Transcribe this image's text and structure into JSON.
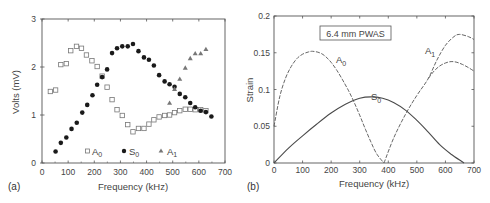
{
  "chart_data": [
    {
      "panel_label": "(a)",
      "type": "scatter",
      "title": "",
      "xlabel": "Frequency (kHz)",
      "ylabel": "Volts (mV)",
      "xlim": [
        0,
        700
      ],
      "ylim": [
        0,
        3
      ],
      "xticks": [
        0,
        100,
        200,
        300,
        400,
        500,
        600,
        700
      ],
      "yticks": [
        0,
        1,
        2,
        3
      ],
      "grid": false,
      "legend_position": "bottom-inside",
      "series": [
        {
          "name": "A0",
          "label_main": "A",
          "label_sub": "0",
          "marker": "open-square",
          "x": [
            32,
            52,
            72,
            93,
            110,
            132,
            151,
            170,
            191,
            211,
            230,
            249,
            268,
            287,
            307,
            328,
            348,
            369,
            390,
            409,
            428,
            448,
            469,
            488,
            507,
            527,
            548,
            567,
            586,
            607,
            627
          ],
          "y": [
            1.49,
            1.52,
            2.05,
            2.07,
            2.34,
            2.43,
            2.39,
            2.25,
            2.13,
            2.01,
            1.81,
            1.58,
            1.32,
            1.11,
            0.99,
            0.8,
            0.65,
            0.72,
            0.72,
            0.81,
            0.9,
            0.96,
            0.99,
            1.0,
            1.05,
            1.09,
            1.12,
            1.12,
            1.11,
            1.11,
            1.09
          ]
        },
        {
          "name": "S0",
          "label_main": "S",
          "label_sub": "0",
          "marker": "filled-circle",
          "x": [
            52,
            72,
            93,
            113,
            133,
            154,
            173,
            193,
            211,
            230,
            249,
            268,
            287,
            307,
            328,
            348,
            369,
            390,
            409,
            428,
            448,
            469,
            488,
            507,
            527,
            548,
            567,
            586,
            607,
            627,
            648
          ],
          "y": [
            0.24,
            0.42,
            0.53,
            0.71,
            0.84,
            1.05,
            1.21,
            1.41,
            1.63,
            1.79,
            1.95,
            2.29,
            2.39,
            2.43,
            2.43,
            2.48,
            2.33,
            2.2,
            2.15,
            2.03,
            1.83,
            1.7,
            1.64,
            1.59,
            1.44,
            1.37,
            1.25,
            1.16,
            1.09,
            1.06,
            0.97
          ]
        },
        {
          "name": "A1",
          "label_main": "A",
          "label_sub": "1",
          "marker": "filled-triangle",
          "x": [
            488,
            507,
            527,
            548,
            567,
            586,
            607,
            627
          ],
          "y": [
            1.25,
            1.54,
            1.75,
            1.98,
            2.18,
            2.28,
            2.28,
            2.37
          ]
        }
      ]
    },
    {
      "panel_label": "(b)",
      "type": "line",
      "title": "",
      "annotation_box": "6.4 mm PWAS",
      "xlabel": "Frequency (kHz)",
      "ylabel": "Strain",
      "xlim": [
        0,
        700
      ],
      "ylim": [
        0,
        0.2
      ],
      "xticks": [
        0,
        100,
        200,
        300,
        400,
        500,
        600,
        700
      ],
      "yticks": [
        0,
        0.05,
        0.1,
        0.15,
        0.2
      ],
      "grid": false,
      "series": [
        {
          "name": "A0",
          "label_main": "A",
          "label_sub": "0",
          "style": "dashed",
          "x": [
            0,
            20,
            40,
            60,
            80,
            100,
            120,
            135,
            160,
            180,
            200,
            220,
            240,
            260,
            280,
            300,
            320,
            340,
            360,
            385
          ],
          "y": [
            0.05,
            0.09,
            0.115,
            0.131,
            0.142,
            0.148,
            0.151,
            0.152,
            0.15,
            0.145,
            0.137,
            0.126,
            0.113,
            0.099,
            0.083,
            0.065,
            0.046,
            0.028,
            0.012,
            0.0
          ]
        },
        {
          "name": "A1",
          "label_main": "A",
          "label_sub": "1",
          "style": "dashed",
          "x": [
            385,
            420,
            460,
            500,
            540,
            570,
            600,
            630,
            650,
            680,
            700
          ],
          "y": [
            0.0,
            0.035,
            0.066,
            0.092,
            0.115,
            0.14,
            0.16,
            0.172,
            0.175,
            0.172,
            0.168
          ]
        },
        {
          "name": "A1-lower-branch",
          "label_main": "",
          "label_sub": "",
          "style": "dashed",
          "x": [
            540,
            560,
            580,
            600,
            620,
            640,
            660,
            680,
            700
          ],
          "y": [
            0.115,
            0.125,
            0.132,
            0.136,
            0.138,
            0.137,
            0.134,
            0.13,
            0.125
          ]
        },
        {
          "name": "S0",
          "label_main": "S",
          "label_sub": "0",
          "style": "solid",
          "x": [
            0,
            50,
            100,
            150,
            200,
            250,
            300,
            340,
            380,
            420,
            460,
            500,
            540,
            580,
            620,
            665
          ],
          "y": [
            0.0,
            0.02,
            0.037,
            0.053,
            0.068,
            0.08,
            0.088,
            0.09,
            0.088,
            0.082,
            0.072,
            0.058,
            0.042,
            0.025,
            0.012,
            0.0
          ]
        }
      ]
    }
  ]
}
